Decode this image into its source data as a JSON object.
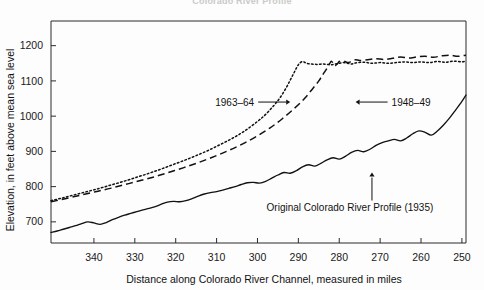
{
  "figure": {
    "faint_top_title": "Colorado River Profile"
  },
  "chart_data": {
    "type": "line",
    "title": "Colorado River Profile",
    "xlabel": "Distance along Colorado River Channel, measured in miles",
    "ylabel": "Elevation, in feet above mean sea level",
    "xlim": [
      350.5,
      249.0
    ],
    "ylim": [
      640,
      1270
    ],
    "x_ticks": [
      340,
      330,
      320,
      310,
      300,
      290,
      280,
      270,
      260,
      250
    ],
    "y_ticks": [
      700,
      800,
      900,
      1000,
      1100,
      1200
    ],
    "x_axis_direction": "decreasing-left-to-right",
    "grid": false,
    "legend": "none-inline-annotations",
    "annotations": [
      {
        "id": "ann-1963",
        "label": "1963–64",
        "points_to_series": "1963-64",
        "arrow": "right",
        "x_mile": 292,
        "y_ft": 1040
      },
      {
        "id": "ann-1948",
        "label": "1948–49",
        "points_to_series": "1948-49",
        "arrow": "left",
        "x_mile": 276,
        "y_ft": 1040
      },
      {
        "id": "ann-original",
        "label": "Original Colorado River Profile (1935)",
        "points_to_series": "Original 1935",
        "arrow": "up",
        "x_mile": 272,
        "y_ft": 840
      }
    ],
    "series": [
      {
        "name": "Original Colorado River Profile (1935)",
        "style": "solid",
        "x": [
          350.5,
          349.0,
          347.5,
          346.0,
          344.5,
          343.0,
          341.5,
          340.0,
          338.5,
          337.0,
          335.5,
          334.0,
          332.5,
          331.0,
          329.5,
          328.0,
          326.5,
          325.0,
          323.5,
          322.0,
          320.5,
          319.0,
          317.5,
          316.0,
          314.5,
          313.0,
          311.5,
          310.0,
          308.5,
          307.0,
          305.5,
          304.0,
          302.5,
          301.0,
          299.5,
          298.0,
          296.5,
          295.0,
          293.5,
          292.0,
          290.5,
          289.0,
          287.5,
          286.0,
          284.5,
          283.0,
          281.5,
          280.0,
          278.5,
          277.0,
          275.5,
          274.0,
          272.5,
          271.0,
          269.5,
          268.0,
          266.5,
          265.0,
          263.5,
          262.0,
          260.5,
          259.0,
          257.5,
          256.0,
          254.5,
          253.0,
          251.5,
          250.0,
          249.0
        ],
        "y": [
          670,
          674,
          679,
          684,
          689,
          695,
          700,
          697,
          693,
          698,
          706,
          713,
          719,
          724,
          729,
          734,
          738,
          743,
          750,
          756,
          758,
          757,
          760,
          766,
          773,
          779,
          783,
          786,
          790,
          795,
          800,
          806,
          811,
          812,
          810,
          815,
          824,
          833,
          840,
          838,
          845,
          856,
          862,
          858,
          866,
          876,
          882,
          878,
          886,
          897,
          903,
          899,
          906,
          917,
          925,
          930,
          934,
          930,
          938,
          950,
          958,
          954,
          946,
          958,
          975,
          995,
          1018,
          1042,
          1060
        ]
      },
      {
        "name": "1948–49",
        "style": "dashed",
        "x": [
          350.5,
          348.0,
          345.0,
          342.0,
          339.0,
          336.0,
          333.0,
          330.0,
          327.0,
          324.0,
          321.0,
          318.0,
          315.0,
          312.0,
          309.0,
          306.0,
          303.0,
          300.0,
          297.0,
          294.0,
          291.0,
          288.5,
          286.5,
          285.0,
          284.0,
          283.2,
          282.6,
          282.2,
          281.9,
          281.6,
          281.3,
          281.0,
          280.5,
          280.0,
          279.0,
          278.0,
          277.0,
          276.0,
          275.0,
          273.0,
          271.0,
          269.0,
          267.0,
          265.0,
          263.0,
          261.0,
          259.0,
          257.0,
          255.0,
          253.0,
          251.0,
          249.0
        ],
        "y": [
          757,
          763,
          771,
          779,
          787,
          795,
          804,
          813,
          822,
          832,
          843,
          854,
          866,
          879,
          893,
          908,
          925,
          944,
          966,
          992,
          1022,
          1050,
          1078,
          1100,
          1118,
          1132,
          1144,
          1152,
          1156,
          1152,
          1145,
          1143,
          1148,
          1155,
          1157,
          1152,
          1155,
          1160,
          1158,
          1160,
          1163,
          1161,
          1164,
          1168,
          1165,
          1168,
          1170,
          1167,
          1171,
          1173,
          1170,
          1173
        ]
      },
      {
        "name": "1963–64",
        "style": "dotted",
        "x": [
          350.5,
          348.0,
          345.0,
          342.0,
          339.0,
          336.0,
          333.0,
          330.0,
          327.0,
          324.0,
          321.0,
          318.0,
          315.0,
          312.0,
          309.0,
          306.0,
          303.0,
          300.0,
          298.0,
          296.0,
          294.5,
          293.0,
          292.0,
          291.2,
          290.5,
          290.0,
          289.5,
          289.0,
          288.5,
          288.0,
          287.0,
          286.0,
          285.0,
          284.0,
          283.0,
          282.0,
          281.0,
          280.0,
          279.0,
          278.0,
          277.0,
          276.0,
          274.0,
          272.0,
          270.0,
          268.0,
          266.0,
          264.0,
          262.0,
          260.0,
          258.0,
          256.0,
          254.0,
          252.0,
          250.0,
          249.0
        ],
        "y": [
          760,
          767,
          776,
          785,
          794,
          804,
          814,
          825,
          836,
          848,
          861,
          874,
          888,
          903,
          920,
          938,
          959,
          985,
          1005,
          1030,
          1052,
          1080,
          1102,
          1120,
          1136,
          1146,
          1152,
          1155,
          1153,
          1150,
          1148,
          1147,
          1147,
          1148,
          1147,
          1146,
          1148,
          1150,
          1152,
          1150,
          1148,
          1151,
          1153,
          1150,
          1152,
          1150,
          1152,
          1154,
          1152,
          1154,
          1152,
          1155,
          1153,
          1156,
          1154,
          1157
        ]
      }
    ]
  }
}
